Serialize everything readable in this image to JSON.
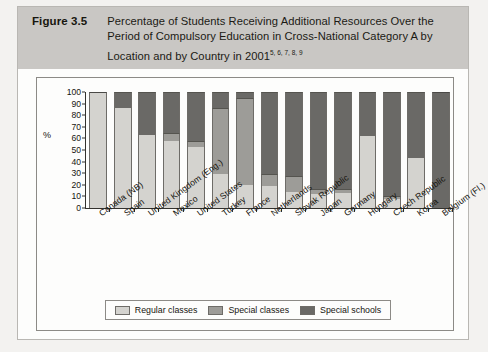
{
  "figure": {
    "number": "Figure 3.5",
    "title_line1": "Percentage of Students Receiving Additional Resources Over the",
    "title_line2": "Period of Compulsory Education in Cross-National Category A by",
    "title_line3": "Location and by Country in 2001",
    "title_superscript": "5, 6, 7, 8, 9"
  },
  "legend": {
    "items": [
      {
        "label": "Regular classes",
        "key": "regular",
        "color": "#d4d3cf"
      },
      {
        "label": "Special classes",
        "key": "special-classes",
        "color": "#9d9c98"
      },
      {
        "label": "Special schools",
        "key": "special-schools",
        "color": "#6a6966"
      }
    ]
  },
  "chart_data": {
    "type": "bar",
    "stacked": true,
    "title": "Percentage of Students Receiving Additional Resources Over the Period of Compulsory Education in Cross-National Category A by Location and by Country in 2001",
    "xlabel": "",
    "ylabel": "%",
    "ylim": [
      0,
      100
    ],
    "yticks": [
      0,
      10,
      20,
      30,
      40,
      50,
      60,
      70,
      80,
      90,
      100
    ],
    "ytick_labels": [
      "0",
      "10",
      "20",
      "30",
      "40",
      "50",
      "60",
      "70",
      "80",
      "90",
      "100"
    ],
    "grid": false,
    "legend_position": "bottom",
    "categories": [
      "Canada (NB)",
      "Spain",
      "United Kingdom (Eng.)",
      "Mexico",
      "United States",
      "Turkey",
      "France",
      "Netherlands",
      "Slovak Republic",
      "Japan",
      "Germany",
      "Hungary",
      "Czech Republic",
      "Korea",
      "Belgium (Fl.)"
    ],
    "series": [
      {
        "name": "Regular classes",
        "color": "#d4d3cf",
        "values": [
          100,
          86,
          63,
          58,
          53,
          29,
          20,
          19,
          14,
          12,
          13,
          62,
          8,
          43,
          0
        ]
      },
      {
        "name": "Special classes",
        "color": "#9d9c98",
        "values": [
          0,
          0,
          0,
          7,
          5,
          57,
          75,
          10,
          14,
          4,
          3,
          0,
          2,
          0,
          0
        ]
      },
      {
        "name": "Special schools",
        "color": "#6a6966",
        "values": [
          0,
          14,
          37,
          35,
          42,
          14,
          5,
          71,
          72,
          84,
          84,
          38,
          90,
          57,
          100
        ]
      }
    ]
  }
}
